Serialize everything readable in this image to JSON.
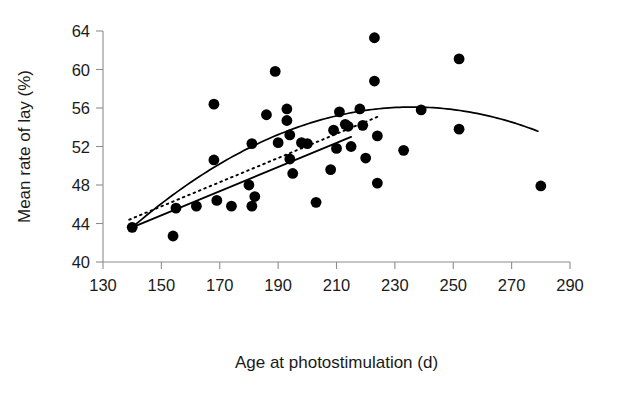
{
  "chart_data": {
    "type": "scatter",
    "title": "",
    "xlabel": "Age at photostimulation (d)",
    "ylabel": "Mean rate of lay (%)",
    "xlim": [
      130,
      290
    ],
    "ylim": [
      40,
      64
    ],
    "xticks": [
      130,
      150,
      170,
      190,
      210,
      230,
      250,
      270,
      290
    ],
    "yticks": [
      40,
      44,
      48,
      52,
      56,
      60,
      64
    ],
    "grid": false,
    "legend": "none",
    "marker": "filled-circle",
    "marker_color": "#000000",
    "points": [
      {
        "x": 140,
        "y": 43.6
      },
      {
        "x": 154,
        "y": 42.7
      },
      {
        "x": 155,
        "y": 45.6
      },
      {
        "x": 162,
        "y": 45.8
      },
      {
        "x": 168,
        "y": 56.4
      },
      {
        "x": 168,
        "y": 50.6
      },
      {
        "x": 169,
        "y": 46.4
      },
      {
        "x": 174,
        "y": 45.8
      },
      {
        "x": 180,
        "y": 48.0
      },
      {
        "x": 181,
        "y": 52.3
      },
      {
        "x": 181,
        "y": 45.8
      },
      {
        "x": 182,
        "y": 46.8
      },
      {
        "x": 186,
        "y": 55.3
      },
      {
        "x": 189,
        "y": 59.8
      },
      {
        "x": 190,
        "y": 52.4
      },
      {
        "x": 193,
        "y": 55.9
      },
      {
        "x": 193,
        "y": 54.7
      },
      {
        "x": 194,
        "y": 53.2
      },
      {
        "x": 194,
        "y": 50.7
      },
      {
        "x": 195,
        "y": 49.2
      },
      {
        "x": 198,
        "y": 52.4
      },
      {
        "x": 200,
        "y": 52.3
      },
      {
        "x": 203,
        "y": 46.2
      },
      {
        "x": 208,
        "y": 49.6
      },
      {
        "x": 209,
        "y": 53.7
      },
      {
        "x": 210,
        "y": 51.8
      },
      {
        "x": 211,
        "y": 55.6
      },
      {
        "x": 213,
        "y": 54.3
      },
      {
        "x": 214,
        "y": 54.1
      },
      {
        "x": 215,
        "y": 52.0
      },
      {
        "x": 218,
        "y": 55.9
      },
      {
        "x": 219,
        "y": 54.2
      },
      {
        "x": 220,
        "y": 50.8
      },
      {
        "x": 223,
        "y": 63.3
      },
      {
        "x": 223,
        "y": 58.8
      },
      {
        "x": 224,
        "y": 53.1
      },
      {
        "x": 224,
        "y": 48.2
      },
      {
        "x": 233,
        "y": 51.6
      },
      {
        "x": 239,
        "y": 55.8
      },
      {
        "x": 252,
        "y": 61.1
      },
      {
        "x": 252,
        "y": 53.8
      },
      {
        "x": 280,
        "y": 47.9
      }
    ],
    "fits": [
      {
        "name": "quadratic-fit",
        "style": "solid",
        "description": "Fitted quadratic curve peaking near 236 d at about 56.1%",
        "x_start": 140,
        "x_end": 279,
        "vertex_x": 236,
        "vertex_y": 56.1,
        "y_at_x_start": 43.6,
        "y_at_x_end": 50.4
      },
      {
        "name": "linear-fit-solid",
        "style": "solid",
        "description": "Straight regression line over the lower age range",
        "x_start": 140,
        "x_end": 215,
        "y_start": 43.6,
        "y_end": 53.0
      },
      {
        "name": "linear-fit-dotted",
        "style": "dotted",
        "description": "Dotted regression line running slightly above the solid line",
        "x_start": 139,
        "x_end": 225,
        "y_start": 44.4,
        "y_end": 55.2
      }
    ]
  }
}
